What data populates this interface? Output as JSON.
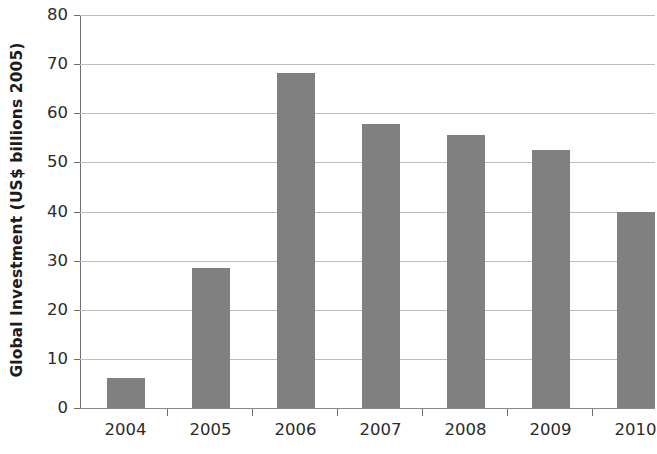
{
  "chart_data": {
    "type": "bar",
    "title": "",
    "subtitle": "",
    "xlabel": "",
    "ylabel": "Global Investment (US$ billions 2005)",
    "categories": [
      "2004",
      "2005",
      "2006",
      "2007",
      "2008",
      "2009",
      "2010"
    ],
    "values": [
      6.1,
      28.5,
      68.2,
      57.8,
      55.5,
      52.6,
      40.0
    ],
    "ylim": [
      0,
      80
    ],
    "yticks": [
      0,
      10,
      20,
      30,
      40,
      50,
      60,
      70,
      80
    ],
    "ytick_labels": [
      "0",
      "10",
      "20",
      "30",
      "40",
      "50",
      "60",
      "70",
      "80"
    ],
    "grid": "horizontal",
    "legend": "none",
    "bar_color": "#808080",
    "gridline_color": "#bdbdbd",
    "axis_color": "#6f6f6f",
    "background_color": "#ffffff",
    "annotations": []
  },
  "axes": {
    "y": {
      "t0": "0",
      "t10": "10",
      "t20": "20",
      "t30": "30",
      "t40": "40",
      "t50": "50",
      "t60": "60",
      "t70": "70",
      "t80": "80"
    },
    "x": {
      "c0": "2004",
      "c1": "2005",
      "c2": "2006",
      "c3": "2007",
      "c4": "2008",
      "c5": "2009",
      "c6": "2010"
    }
  },
  "labels": {
    "y_axis_title": "Global Investment (US$ billions 2005)"
  }
}
